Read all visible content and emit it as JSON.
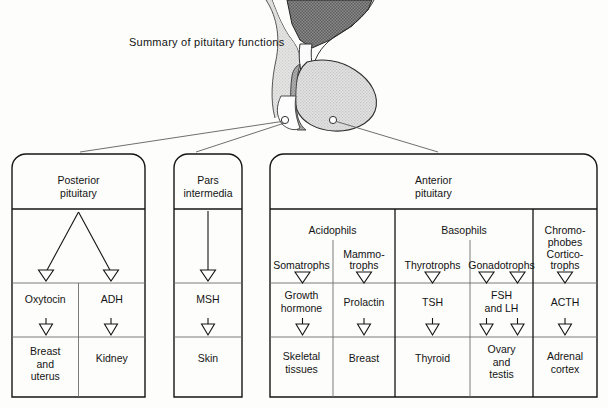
{
  "title": "Summary of pituitary functions",
  "colors": {
    "ink": "#141414",
    "rule_major": "#141414",
    "rule_minor": "#6d6d6d",
    "hypothalamus_fill": "#7d7d7d",
    "anterior_fill": "#dcdcdc",
    "pars_fill": "#9a9a9a",
    "posterior_fill": "#f2f2f2",
    "page_bg": "#fdfdfb"
  },
  "anatomy": {
    "name": "pituitary-gland-sagittal",
    "parts": [
      {
        "name": "hypothalamus",
        "shade": "dark"
      },
      {
        "name": "pituitary-stalk",
        "shade": "light"
      },
      {
        "name": "anterior-lobe",
        "shade": "light-gray"
      },
      {
        "name": "pars-intermedia-strip",
        "shade": "mid-gray"
      },
      {
        "name": "posterior-lobe",
        "shade": "white"
      }
    ],
    "markers": [
      {
        "name": "posterior-marker",
        "cx": 285,
        "cy": 120
      },
      {
        "name": "anterior-marker",
        "cx": 333,
        "cy": 120
      }
    ]
  },
  "panels": [
    {
      "id": "posterior",
      "heading": "Posterior\npituitary",
      "groups": [],
      "cell_types": [],
      "columns": [
        {
          "cell_type": "",
          "hormone": "Oxytocin",
          "target": "Breast\nand\nuterus"
        },
        {
          "cell_type": "",
          "hormone": "ADH",
          "target": "Kidney"
        }
      ],
      "branch": "v-split"
    },
    {
      "id": "pars-intermedia",
      "heading": "Pars\nintermedia",
      "groups": [],
      "columns": [
        {
          "cell_type": "",
          "hormone": "MSH",
          "target": "Skin"
        }
      ],
      "branch": "straight"
    },
    {
      "id": "anterior",
      "heading": "Anterior\npituitary",
      "groups": [
        {
          "label": "Acidophils",
          "span": 2
        },
        {
          "label": "Basophils",
          "span": 2
        },
        {
          "label": "",
          "span": 1
        }
      ],
      "columns": [
        {
          "cell_type": "Somatrophs",
          "hormone": "Growth\nhormone",
          "target": "Skeletal\ntissues",
          "arrows": 1
        },
        {
          "cell_type": "Mammo-\ntrophs",
          "hormone": "Prolactin",
          "target": "Breast",
          "arrows": 1
        },
        {
          "cell_type": "Thyrotrophs",
          "hormone": "TSH",
          "target": "Thyroid",
          "arrows": 1
        },
        {
          "cell_type": "Gonadotrophs",
          "hormone": "FSH\nand LH",
          "target": "Ovary\nand\ntestis",
          "arrows": 2
        },
        {
          "cell_type": "Chromo-\nphobes\nCortico-\ntrophs",
          "hormone": "ACTH",
          "target": "Adrenal\ncortex",
          "arrows": 1
        }
      ],
      "branch": "straight"
    }
  ]
}
